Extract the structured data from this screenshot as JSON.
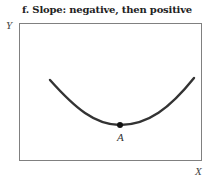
{
  "title": "f. Slope: negative, then positive",
  "axes": {
    "x_label": "X",
    "y_label": "Y"
  },
  "curve": {
    "description": "U-shaped curve, slope negative then positive",
    "color": "#333333"
  },
  "point": {
    "label": "A",
    "description": "Minimum point where slope is zero"
  },
  "colors": {
    "frame": "#808080",
    "curve": "#333333",
    "point": "#111111"
  }
}
